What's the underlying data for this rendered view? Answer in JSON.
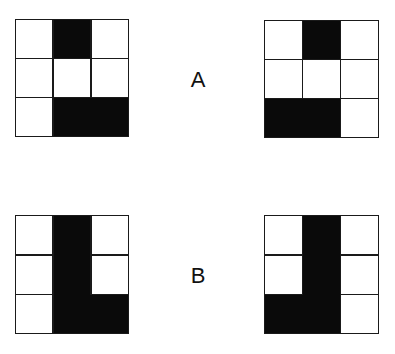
{
  "colors": {
    "fill": "#0a0a0a",
    "empty": "#ffffff",
    "line": "#1a1a1a"
  },
  "pairs": [
    {
      "label": "A",
      "left": {
        "cells": [
          [
            0,
            1,
            0
          ],
          [
            0,
            0,
            0
          ],
          [
            0,
            1,
            1
          ]
        ]
      },
      "right": {
        "cells": [
          [
            0,
            1,
            0
          ],
          [
            0,
            0,
            0
          ],
          [
            1,
            1,
            0
          ]
        ]
      }
    },
    {
      "label": "B",
      "left": {
        "cells": [
          [
            0,
            1,
            0
          ],
          [
            0,
            1,
            0
          ],
          [
            0,
            1,
            1
          ]
        ]
      },
      "right": {
        "cells": [
          [
            0,
            1,
            0
          ],
          [
            0,
            1,
            0
          ],
          [
            1,
            1,
            0
          ]
        ]
      }
    }
  ]
}
